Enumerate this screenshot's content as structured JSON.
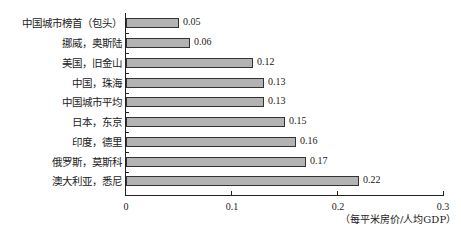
{
  "chart_data": {
    "type": "bar",
    "orientation": "horizontal",
    "title": "",
    "categories": [
      "中国城市榜首（包头）",
      "挪威，奥斯陆",
      "美国，旧金山",
      "中国，珠海",
      "中国城市平均",
      "日本，东京",
      "印度，德里",
      "俄罗斯，莫斯科",
      "澳大利亚，悉尼"
    ],
    "values": [
      0.05,
      0.06,
      0.12,
      0.13,
      0.13,
      0.15,
      0.16,
      0.17,
      0.22
    ],
    "value_labels": [
      "0.05",
      "0.06",
      "0.12",
      "0.13",
      "0.13",
      "0.15",
      "0.16",
      "0.17",
      "0.22"
    ],
    "xlabel": "（每平米房价/人均GDP）",
    "ylabel": "",
    "xlim": [
      0,
      0.3
    ],
    "x_ticks": [
      "0",
      "0.1",
      "0.2",
      "0.3"
    ],
    "grid": false,
    "legend": null,
    "bar_color": "#b3b3b3",
    "bar_edge_color": "#333333"
  }
}
